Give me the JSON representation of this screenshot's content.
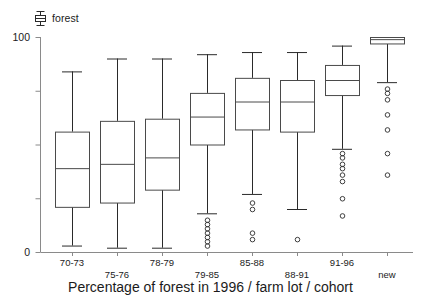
{
  "legend": {
    "label": "forest",
    "glyph": "boxplot-glyph-icon"
  },
  "axes": {
    "y_tick_top_label": "100",
    "y_tick_bottom_label": "0",
    "x_title": "Percentage of forest in 1996 / farm lot / cohort"
  },
  "chart_data": {
    "type": "boxplot",
    "title": "",
    "xlabel": "Percentage of forest in 1996 / farm lot / cohort",
    "ylabel": "",
    "ylim": [
      0,
      100
    ],
    "yticks": [
      0,
      25,
      50,
      75,
      100
    ],
    "ytick_labels": [
      "0",
      "",
      "",
      "",
      "100"
    ],
    "grid": false,
    "legend": [
      "forest"
    ],
    "legend_position": "top-left",
    "categories": [
      "70-73",
      "75-76",
      "78-79",
      "79-85",
      "85-88",
      "88-91",
      "91-96",
      "new"
    ],
    "boxes": [
      {
        "category": "70-73",
        "whisker_low": 3,
        "q1": 21,
        "median": 39,
        "q3": 56,
        "whisker_high": 84,
        "outliers": []
      },
      {
        "category": "75-76",
        "whisker_low": 2,
        "q1": 23,
        "median": 41,
        "q3": 61,
        "whisker_high": 90,
        "outliers": []
      },
      {
        "category": "78-79",
        "whisker_low": 2,
        "q1": 29,
        "median": 44,
        "q3": 62,
        "whisker_high": 90,
        "outliers": []
      },
      {
        "category": "79-85",
        "whisker_low": 18,
        "q1": 50,
        "median": 63,
        "q3": 74,
        "whisker_high": 92,
        "outliers": [
          15,
          13,
          11,
          9,
          7,
          5,
          3
        ]
      },
      {
        "category": "85-88",
        "whisker_low": 27,
        "q1": 57,
        "median": 70,
        "q3": 81,
        "whisker_high": 93,
        "outliers": [
          23,
          20,
          9,
          6
        ]
      },
      {
        "category": "88-91",
        "whisker_low": 20,
        "q1": 56,
        "median": 70,
        "q3": 80,
        "whisker_high": 93,
        "outliers": [
          6
        ]
      },
      {
        "category": "91-96",
        "whisker_low": 48,
        "q1": 73,
        "median": 80,
        "q3": 87,
        "whisker_high": 96,
        "outliers": [
          46,
          44,
          41,
          39,
          36,
          33,
          25,
          17
        ]
      },
      {
        "category": "new",
        "whisker_low": 79,
        "q1": 97,
        "median": 99,
        "q3": 100,
        "whisker_high": 100,
        "outliers": [
          76,
          74,
          71,
          64,
          57,
          46,
          36
        ]
      }
    ]
  }
}
